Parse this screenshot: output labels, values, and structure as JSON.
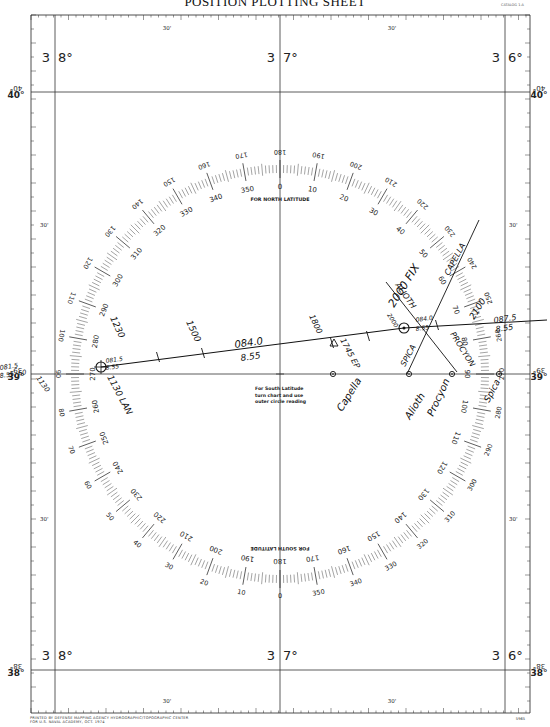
{
  "sheet": {
    "title": "POSITION PLOTTING SHEET",
    "catalog_text": "CATALOG 1-A",
    "footer_line1": "PRINTED BY DEFENSE MAPPING AGENCY HYDROGRAPHIC/TOPOGRAPHIC CENTER",
    "footer_line2": "FOR U.S. NAVAL ACADEMY, OCT. 1974",
    "footer_number": "5965"
  },
  "longitudes": [
    {
      "label_a": "3",
      "label_b": "8°",
      "x": 55
    },
    {
      "label_a": "3",
      "label_b": "7°",
      "x": 280
    },
    {
      "label_a": "3",
      "label_b": "6°",
      "x": 505
    }
  ],
  "minute_labels": {
    "top": [
      "30'",
      "30'"
    ],
    "bottom": [
      "30'",
      "30'"
    ],
    "left": [
      "30'",
      "30'"
    ],
    "right": [
      "30'",
      "30'"
    ]
  },
  "latitudes": [
    {
      "label": "40°",
      "inverted": "40°",
      "y": 92
    },
    {
      "label": "39°",
      "inverted": "39°",
      "y": 374
    },
    {
      "label": "38°",
      "inverted": "38°",
      "y": 670
    }
  ],
  "compass": {
    "cx": 280,
    "cy": 374,
    "r": 205,
    "north_label": "FOR NORTH LATITUDE",
    "south_label": "FOR SOUTH LATITUDE",
    "south_note": [
      "For South Latitude",
      "turn chart and use",
      "outer circle reading"
    ],
    "inner_labels_north": [
      "0",
      "10",
      "20",
      "30",
      "40",
      "50",
      "60",
      "70",
      "80",
      "90",
      "100",
      "110",
      "120",
      "130",
      "140",
      "150",
      "160",
      "170",
      "180",
      "190",
      "200",
      "210",
      "220",
      "230",
      "240",
      "250",
      "260",
      "270",
      "280",
      "290",
      "300",
      "310",
      "320",
      "330",
      "340",
      "350"
    ]
  },
  "plot": {
    "track": {
      "course_label": "084.0",
      "speed_label": "8.55",
      "start_time": "1130",
      "start_label": "1130 LAN",
      "start_fix_course": "081.5",
      "start_fix_speed": "8.55",
      "time_marks": [
        "1230",
        "1500",
        "1800"
      ],
      "ep_label": "1745 EP",
      "fix_time": "2000",
      "fix_label": "2000 FIX",
      "fix_course": "084.0",
      "fix_speed": "8.55",
      "next_time": "2100",
      "next_course": "087.5",
      "next_speed": "8.55"
    },
    "left_margin_note": {
      "course": "081.5",
      "speed": "8.55",
      "extra": "60",
      "time": "1130"
    },
    "lop_labels": [
      "ALIOTH",
      "CAPELLA",
      "SPICA",
      "PROCYON"
    ],
    "star_labels": [
      "Capella",
      "Alioth",
      "Procyon",
      "Spica"
    ]
  }
}
